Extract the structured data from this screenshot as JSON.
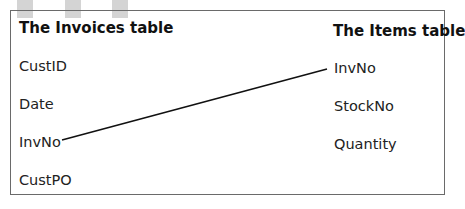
{
  "diagram": {
    "invoices_table": {
      "title": "The Invoices table",
      "fields": [
        "CustID",
        "Date",
        "InvNo",
        "CustPO"
      ]
    },
    "items_table": {
      "title": "The Items table",
      "fields": [
        "InvNo",
        "StockNo",
        "Quantity"
      ]
    },
    "relationship": {
      "from": "InvNo",
      "to": "InvNo"
    }
  }
}
